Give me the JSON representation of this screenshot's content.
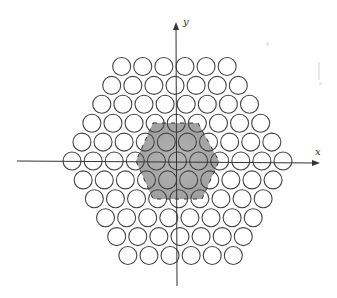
{
  "figure": {
    "background": "#ffffff",
    "axes": {
      "x": {
        "label": "x",
        "from": [
          17,
          161
        ],
        "to": [
          320,
          163
        ],
        "color": "#333333"
      },
      "y": {
        "label": "y",
        "from": [
          177,
          286
        ],
        "to": [
          176,
          22
        ],
        "color": "#333333"
      }
    },
    "packing": {
      "center": [
        177.5,
        161
      ],
      "dx": 21.1,
      "dy": 18.9,
      "radius": 9,
      "shear_per_row": 0.62,
      "row_counts": [
        6,
        7,
        8,
        9,
        10,
        11,
        10,
        9,
        8,
        7,
        6
      ],
      "total_circles": 91,
      "stroke_color": "#444444",
      "stroke_width": 1.1,
      "fill": "none"
    },
    "shaded_region": {
      "shape": "hexagon",
      "vertices": [
        [
          153,
          123
        ],
        [
          198,
          123
        ],
        [
          219,
          161
        ],
        [
          202,
          199
        ],
        [
          153,
          199
        ],
        [
          136,
          161
        ]
      ],
      "fill_color": "#a9a9a9",
      "edge_color": "#333333",
      "edge_style": "dashed"
    },
    "artifacts": [
      {
        "x": 266,
        "y": 42,
        "w": 3,
        "h": 4
      },
      {
        "x": 318,
        "y": 62,
        "w": 2,
        "h": 18
      },
      {
        "x": 319,
        "y": 82,
        "w": 3,
        "h": 3
      }
    ]
  }
}
